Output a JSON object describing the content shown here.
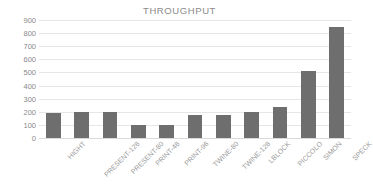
{
  "chart_data": {
    "type": "bar",
    "title": "THROUGHPUT",
    "xlabel": "",
    "ylabel": "",
    "ylim": [
      0,
      900
    ],
    "ytick_step": 100,
    "yticks": [
      900,
      800,
      700,
      600,
      500,
      400,
      300,
      200,
      100,
      0
    ],
    "grid": true,
    "legend": false,
    "bar_color": "#6e6e6e",
    "text_color": "#8a8a8a",
    "gridline_color": "#e6e6e6",
    "categories": [
      "HIGHT",
      "PRESENT-128",
      "PRESENT-80",
      "PRINT-48",
      "PRINT-96",
      "TWINE-80",
      "TWINE-128",
      "LBLOCK",
      "PICCOLO",
      "SIMON",
      "SPECK"
    ],
    "values": [
      188,
      200,
      200,
      100,
      98,
      175,
      175,
      196,
      237,
      510,
      850
    ]
  }
}
